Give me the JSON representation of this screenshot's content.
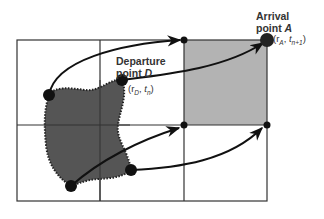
{
  "diagram": {
    "type": "semi-lagrangian trajectory grid",
    "grid": {
      "x_lines": [
        17,
        100,
        184,
        267
      ],
      "y_lines": [
        40,
        125,
        201
      ],
      "line_color": "#333333"
    },
    "arrival_cell": {
      "fill": "#b3b3b3",
      "x1": 184,
      "y1": 40,
      "x2": 267,
      "y2": 125
    },
    "departure_region": {
      "fill": "#555555",
      "border": "dotted"
    },
    "grid_nodes": [
      {
        "x": 184,
        "y": 40
      },
      {
        "x": 184,
        "y": 125
      },
      {
        "x": 267,
        "y": 125
      }
    ],
    "arrival_point": {
      "title_line1": "Arrival",
      "title_line2_prefix": "point ",
      "title_symbol": "A",
      "coord_r": "r",
      "coord_r_sub": "A",
      "coord_t": "t",
      "coord_t_sub": "n+1",
      "x": 267,
      "y": 40
    },
    "departure_point": {
      "title_line1": "Departure",
      "title_line2_prefix": "point ",
      "title_symbol": "D",
      "coord_r": "r",
      "coord_r_sub": "D",
      "coord_t": "t",
      "coord_t_sub": "n",
      "x": 122,
      "y": 80
    },
    "trajectories": [
      {
        "from": [
          49,
          95
        ],
        "to": [
          184,
          40
        ]
      },
      {
        "from": [
          122,
          80
        ],
        "to": [
          267,
          40
        ]
      },
      {
        "from": [
          71,
          186
        ],
        "to": [
          184,
          125
        ]
      },
      {
        "from": [
          131,
          170
        ],
        "to": [
          267,
          125
        ]
      }
    ]
  }
}
